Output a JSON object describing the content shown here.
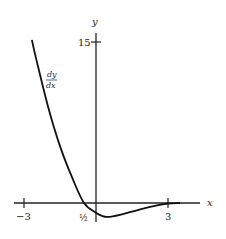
{
  "chart_data": {
    "type": "line",
    "title": "",
    "xlabel": "x",
    "ylabel": "y",
    "series": [
      {
        "name": "dy/dx",
        "label_num": "dy",
        "label_den": "dx",
        "x": [
          -2.67,
          -2.5,
          -2.0,
          -1.5,
          -1.0,
          -0.5,
          0.0,
          0.25,
          0.5,
          1.0,
          1.5,
          2.0,
          2.5,
          3.0,
          3.5
        ],
        "y": [
          15.2,
          13.5,
          9.0,
          5.3,
          2.4,
          0.0,
          -0.9,
          -1.2,
          -1.3,
          -1.1,
          -0.8,
          -0.5,
          -0.25,
          -0.05,
          0.0
        ]
      }
    ],
    "x_ticks": [
      {
        "value": -3,
        "label": "−3"
      },
      {
        "value": -0.5,
        "label": "½"
      },
      {
        "value": 3,
        "label": "3"
      }
    ],
    "y_ticks": [
      {
        "value": 15,
        "label": "15"
      }
    ],
    "xlim": [
      -3.4,
      4.3
    ],
    "ylim": [
      -1.6,
      16.8
    ],
    "grid": false,
    "legend": "none"
  }
}
